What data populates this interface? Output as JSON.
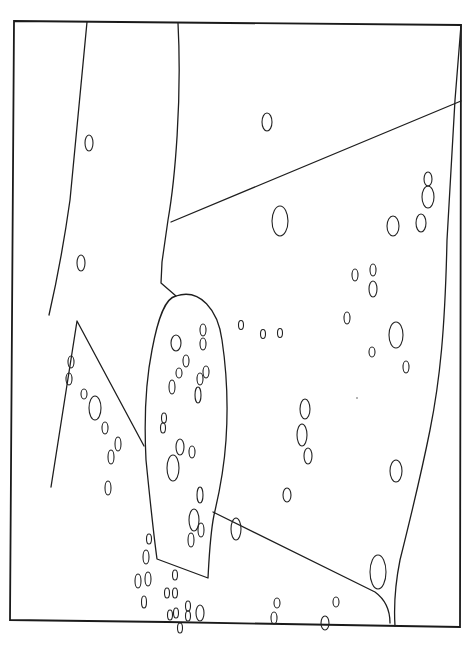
{
  "diagram": {
    "width": 469,
    "height": 664,
    "background": "#ffffff",
    "stroke_color": "#1e1e1e",
    "frame": "M14,21 L228,23 L461,25 L460,627 L400,626 L167,622 L10,620 Z",
    "boundaries": [
      {
        "name": "left-arc-line",
        "d": "M87,22 C80,90 75,150 70,200 C63,250 57,280 49,315"
      },
      {
        "name": "center-top-line",
        "d": "M178,23 C182,100 175,180 168,220 L162,262 L161,283 L176,296"
      },
      {
        "name": "diagonal-upper-line",
        "d": "M171,222 L461,101"
      },
      {
        "name": "right-edge-line",
        "d": "M461,25 L455,100 L447,240 C445,330 440,380 430,430 C420,480 410,520 400,560 C394,590 394,610 395,626"
      },
      {
        "name": "left-triangle",
        "d": "M51,487 L77,321 L144,446"
      },
      {
        "name": "central-blob",
        "d": "M176,296 C200,288 218,310 222,340 C228,380 228,410 226,440 C224,470 220,490 214,515 C210,535 209,560 208,578 L157,559 C153,530 150,500 146,460 C144,420 146,380 152,350 C158,318 165,298 176,296 Z"
      },
      {
        "name": "blob-to-right-diagonal",
        "d": "M213,512 L375,592 C386,600 390,612 390,623"
      }
    ],
    "cells": [
      {
        "cx": 89,
        "cy": 143,
        "rx": 4,
        "ry": 8
      },
      {
        "cx": 81,
        "cy": 263,
        "rx": 4,
        "ry": 8
      },
      {
        "cx": 267,
        "cy": 122,
        "rx": 5,
        "ry": 9
      },
      {
        "cx": 280,
        "cy": 221,
        "rx": 8,
        "ry": 15
      },
      {
        "cx": 393,
        "cy": 226,
        "rx": 6,
        "ry": 10
      },
      {
        "cx": 421,
        "cy": 223,
        "rx": 5,
        "ry": 9
      },
      {
        "cx": 428,
        "cy": 179,
        "rx": 4,
        "ry": 7
      },
      {
        "cx": 428,
        "cy": 197,
        "rx": 6,
        "ry": 11
      },
      {
        "cx": 355,
        "cy": 275,
        "rx": 3,
        "ry": 6
      },
      {
        "cx": 373,
        "cy": 270,
        "rx": 3,
        "ry": 6
      },
      {
        "cx": 373,
        "cy": 289,
        "rx": 4,
        "ry": 8
      },
      {
        "cx": 347,
        "cy": 318,
        "rx": 3,
        "ry": 6
      },
      {
        "cx": 396,
        "cy": 335,
        "rx": 7,
        "ry": 13
      },
      {
        "cx": 372,
        "cy": 352,
        "rx": 3,
        "ry": 5
      },
      {
        "cx": 406,
        "cy": 367,
        "rx": 3,
        "ry": 6
      },
      {
        "cx": 241,
        "cy": 325,
        "rx": 2.5,
        "ry": 4.5
      },
      {
        "cx": 263,
        "cy": 334,
        "rx": 2.5,
        "ry": 4.5
      },
      {
        "cx": 280,
        "cy": 333,
        "rx": 2.5,
        "ry": 4.5
      },
      {
        "cx": 305,
        "cy": 409,
        "rx": 5,
        "ry": 10
      },
      {
        "cx": 302,
        "cy": 435,
        "rx": 5,
        "ry": 11
      },
      {
        "cx": 308,
        "cy": 456,
        "rx": 4,
        "ry": 8
      },
      {
        "cx": 396,
        "cy": 471,
        "rx": 6,
        "ry": 11
      },
      {
        "cx": 287,
        "cy": 495,
        "rx": 4,
        "ry": 7
      },
      {
        "cx": 236,
        "cy": 529,
        "rx": 5,
        "ry": 11
      },
      {
        "cx": 378,
        "cy": 572,
        "rx": 8,
        "ry": 17
      },
      {
        "cx": 277,
        "cy": 603,
        "rx": 3,
        "ry": 5
      },
      {
        "cx": 274,
        "cy": 618,
        "rx": 3,
        "ry": 6
      },
      {
        "cx": 336,
        "cy": 602,
        "rx": 3,
        "ry": 5
      },
      {
        "cx": 325,
        "cy": 623,
        "rx": 4,
        "ry": 7
      },
      {
        "cx": 71,
        "cy": 362,
        "rx": 3,
        "ry": 6
      },
      {
        "cx": 69,
        "cy": 379,
        "rx": 3,
        "ry": 6
      },
      {
        "cx": 84,
        "cy": 394,
        "rx": 3,
        "ry": 5
      },
      {
        "cx": 95,
        "cy": 408,
        "rx": 6,
        "ry": 12
      },
      {
        "cx": 105,
        "cy": 428,
        "rx": 3,
        "ry": 6
      },
      {
        "cx": 118,
        "cy": 444,
        "rx": 3,
        "ry": 7
      },
      {
        "cx": 111,
        "cy": 457,
        "rx": 3,
        "ry": 7
      },
      {
        "cx": 108,
        "cy": 488,
        "rx": 3,
        "ry": 7
      },
      {
        "cx": 176,
        "cy": 343,
        "rx": 5,
        "ry": 8
      },
      {
        "cx": 203,
        "cy": 330,
        "rx": 3,
        "ry": 6
      },
      {
        "cx": 203,
        "cy": 344,
        "rx": 3,
        "ry": 6
      },
      {
        "cx": 186,
        "cy": 361,
        "rx": 3,
        "ry": 6
      },
      {
        "cx": 179,
        "cy": 373,
        "rx": 3,
        "ry": 5
      },
      {
        "cx": 172,
        "cy": 387,
        "rx": 3,
        "ry": 7
      },
      {
        "cx": 206,
        "cy": 372,
        "rx": 3,
        "ry": 6
      },
      {
        "cx": 200,
        "cy": 379,
        "rx": 3,
        "ry": 6
      },
      {
        "cx": 198,
        "cy": 395,
        "rx": 3,
        "ry": 8
      },
      {
        "cx": 164,
        "cy": 418,
        "rx": 2.5,
        "ry": 5
      },
      {
        "cx": 163,
        "cy": 428,
        "rx": 2.5,
        "ry": 5
      },
      {
        "cx": 180,
        "cy": 447,
        "rx": 4,
        "ry": 8
      },
      {
        "cx": 192,
        "cy": 452,
        "rx": 3,
        "ry": 6
      },
      {
        "cx": 173,
        "cy": 468,
        "rx": 6,
        "ry": 13
      },
      {
        "cx": 200,
        "cy": 495,
        "rx": 3,
        "ry": 8
      },
      {
        "cx": 194,
        "cy": 520,
        "rx": 5,
        "ry": 11
      },
      {
        "cx": 201,
        "cy": 530,
        "rx": 3,
        "ry": 7
      },
      {
        "cx": 191,
        "cy": 540,
        "rx": 3,
        "ry": 7
      },
      {
        "cx": 149,
        "cy": 539,
        "rx": 2.5,
        "ry": 5
      },
      {
        "cx": 146,
        "cy": 557,
        "rx": 3,
        "ry": 7
      },
      {
        "cx": 138,
        "cy": 581,
        "rx": 3,
        "ry": 7
      },
      {
        "cx": 148,
        "cy": 579,
        "rx": 3,
        "ry": 7
      },
      {
        "cx": 144,
        "cy": 602,
        "rx": 2.5,
        "ry": 6
      },
      {
        "cx": 175,
        "cy": 575,
        "rx": 2.5,
        "ry": 5
      },
      {
        "cx": 167,
        "cy": 593,
        "rx": 2.5,
        "ry": 5
      },
      {
        "cx": 175,
        "cy": 593,
        "rx": 2.5,
        "ry": 5
      },
      {
        "cx": 170,
        "cy": 615,
        "rx": 2.5,
        "ry": 5
      },
      {
        "cx": 176,
        "cy": 613,
        "rx": 2.5,
        "ry": 5
      },
      {
        "cx": 188,
        "cy": 606,
        "rx": 2.5,
        "ry": 5
      },
      {
        "cx": 188,
        "cy": 616,
        "rx": 2.5,
        "ry": 5
      },
      {
        "cx": 200,
        "cy": 613,
        "rx": 4,
        "ry": 8
      },
      {
        "cx": 180,
        "cy": 628,
        "rx": 2.5,
        "ry": 5
      }
    ],
    "specks": [
      {
        "cx": 357,
        "cy": 398,
        "r": 0.8
      }
    ]
  }
}
